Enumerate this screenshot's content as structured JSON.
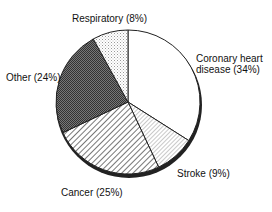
{
  "chart_data": {
    "type": "pie",
    "title": "",
    "slices": [
      {
        "label": "Coronary heart disease",
        "value": 34,
        "display": "Coronary heart\ndisease (34%)",
        "pattern": "white"
      },
      {
        "label": "Stroke",
        "value": 9,
        "display": "Stroke (9%)",
        "pattern": "fine-diagonal"
      },
      {
        "label": "Cancer",
        "value": 25,
        "display": "Cancer (25%)",
        "pattern": "diagonal-stripes"
      },
      {
        "label": "Other",
        "value": 24,
        "display": "Other (24%)",
        "pattern": "dark-crosshatch"
      },
      {
        "label": "Respiratory",
        "value": 8,
        "display": "Respiratory (8%)",
        "pattern": "light-dots"
      }
    ],
    "start_angle_deg": 0,
    "direction": "clockwise"
  },
  "labels": {
    "respiratory": "Respiratory (8%)",
    "coronary_line1": "Coronary heart",
    "coronary_line2": "disease (34%)",
    "other": "Other (24%)",
    "stroke": "Stroke (9%)",
    "cancer": "Cancer (25%)"
  }
}
